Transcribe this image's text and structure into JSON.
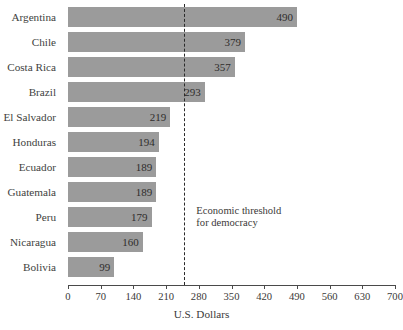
{
  "chart_data": {
    "type": "bar",
    "orientation": "horizontal",
    "title": "",
    "xlabel": "U.S. Dollars",
    "ylabel": "",
    "categories": [
      "Argentina",
      "Chile",
      "Costa Rica",
      "Brazil",
      "El Salvador",
      "Honduras",
      "Ecuador",
      "Guatemala",
      "Peru",
      "Nicaragua",
      "Bolivia"
    ],
    "values": [
      490,
      379,
      357,
      293,
      219,
      194,
      189,
      189,
      179,
      160,
      99
    ],
    "value_labels": [
      "490",
      "379",
      "357",
      "293",
      "219",
      "194",
      "189",
      "189",
      "179",
      "160",
      "99"
    ],
    "xlim": [
      0,
      700
    ],
    "xticks": [
      0,
      70,
      140,
      210,
      280,
      350,
      420,
      490,
      560,
      630,
      700
    ],
    "xtick_labels": [
      "0",
      "70",
      "140",
      "210",
      "280",
      "350",
      "420",
      "490",
      "560",
      "630",
      "700"
    ],
    "grid": false,
    "legend": null,
    "bar_color": "#9b9b9b",
    "axis_color": "#4a4a4a",
    "text_color": "#3b3938",
    "background": "#ffffff",
    "annotations": [
      {
        "name": "economic-threshold",
        "kind": "vertical-dashed-line",
        "x_value": 249,
        "line_style": "dashed",
        "line_color": "#2a2a2a",
        "label_line1": "Economic threshold",
        "label_line2": "for democracy"
      }
    ]
  }
}
